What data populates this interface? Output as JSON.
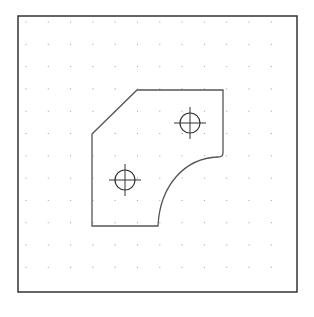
{
  "drawing": {
    "background": "#ffffff",
    "frame": {
      "x": 18,
      "y": 16,
      "width": 279,
      "height": 276,
      "stroke": "#333333"
    },
    "grid": {
      "start_x": 26,
      "start_y": 22,
      "step_x": 22.3,
      "step_y": 22.3,
      "cols": 12,
      "rows": 12,
      "dot_color": "#9a9a9a"
    },
    "part_outline": {
      "stroke": "#555555",
      "path": "M 92 134 L 137 90 L 223 90 L 223 153 Q 223 157 218 157 C 185 158 160 185 158 226 L 92 226 Z"
    },
    "holes": [
      {
        "cx": 190,
        "cy": 123,
        "r": 10,
        "cross": 16
      },
      {
        "cx": 125,
        "cy": 180,
        "r": 10,
        "cross": 16
      }
    ]
  }
}
